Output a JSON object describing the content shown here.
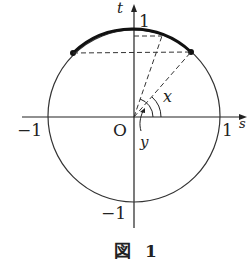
{
  "figure": {
    "caption": "図 1",
    "axes": {
      "x_label": "s",
      "y_label": "t"
    },
    "ticks": {
      "x_neg": "−1",
      "x_pos": "1",
      "y_pos": "1",
      "y_neg": "−1",
      "origin": "O"
    },
    "angles": {
      "outer": "x",
      "inner": "y"
    },
    "colors": {
      "stroke": "#222222",
      "background": "#ffffff"
    }
  }
}
